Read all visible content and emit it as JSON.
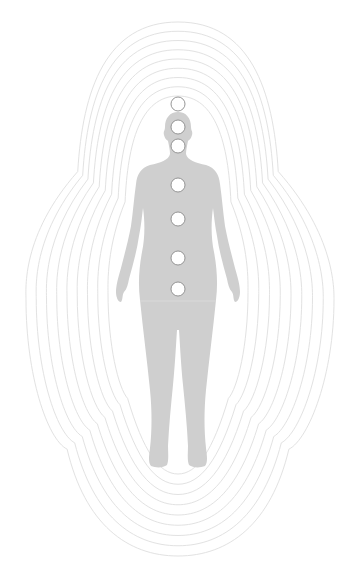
{
  "illustration": {
    "subject": "human figure with chakra points and aura field",
    "colors": {
      "background": "#ffffff",
      "body": "#cfcfcf",
      "aura_ring": "#e2e2e2",
      "chakra_fill": "#ffffff",
      "chakra_stroke": "#8a8a8a"
    },
    "aura": {
      "center_x": 178,
      "ring_count": 9,
      "outer": {
        "left": 26,
        "right": 334,
        "top": 22,
        "bottom": 556
      }
    },
    "chakras": [
      {
        "name": "crown",
        "cx": 178,
        "cy": 104,
        "r": 7
      },
      {
        "name": "third-eye",
        "cx": 178,
        "cy": 127,
        "r": 7
      },
      {
        "name": "throat",
        "cx": 178,
        "cy": 146,
        "r": 7
      },
      {
        "name": "heart",
        "cx": 178,
        "cy": 185,
        "r": 7
      },
      {
        "name": "solar-plexus",
        "cx": 178,
        "cy": 219,
        "r": 7
      },
      {
        "name": "sacral",
        "cx": 178,
        "cy": 258,
        "r": 7
      },
      {
        "name": "root",
        "cx": 178,
        "cy": 289,
        "r": 7
      }
    ]
  }
}
